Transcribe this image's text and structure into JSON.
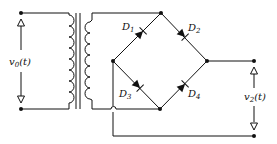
{
  "diagram": {
    "type": "circuit",
    "labels": {
      "input_voltage": "v",
      "input_voltage_sub": "0",
      "input_voltage_arg": "(t)",
      "output_voltage": "v",
      "output_voltage_sub": "2",
      "output_voltage_arg": "(t)"
    },
    "diodes": [
      {
        "id": "D1",
        "name": "D",
        "sub": "1"
      },
      {
        "id": "D2",
        "name": "D",
        "sub": "2"
      },
      {
        "id": "D3",
        "name": "D",
        "sub": "3"
      },
      {
        "id": "D4",
        "name": "D",
        "sub": "4"
      }
    ],
    "components": [
      "transformer",
      "diode bridge",
      "output terminals"
    ],
    "colors": {
      "line": "#111111",
      "background": "#ffffff"
    }
  }
}
